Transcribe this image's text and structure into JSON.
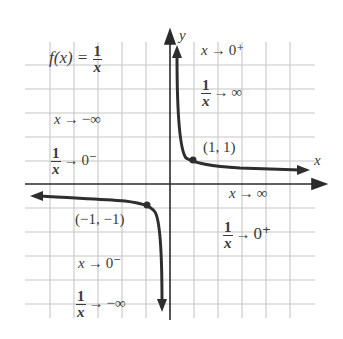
{
  "title": {
    "lhs": "f(x) =",
    "num": "1",
    "den": "x"
  },
  "axes": {
    "x_label": "x",
    "y_label": "y"
  },
  "points": [
    {
      "label": "(1, 1)",
      "x": 1,
      "y": 1
    },
    {
      "label": "(−1, −1)",
      "x": -1,
      "y": -1
    }
  ],
  "annotations": {
    "q1_top": {
      "left": "x",
      "arrow": "→",
      "right": "0⁺"
    },
    "q1_mid": {
      "num": "1",
      "den": "x",
      "arrow": "→",
      "right": "∞"
    },
    "q2_top": {
      "left": "x",
      "arrow": "→",
      "right": "−∞"
    },
    "q2_mid": {
      "num": "1",
      "den": "x",
      "arrow": "→",
      "right": "0⁻"
    },
    "q4_top": {
      "left": "x",
      "arrow": "→",
      "right": "∞"
    },
    "q4_mid": {
      "num": "1",
      "den": "x",
      "arrow": "→",
      "right": "0⁺"
    },
    "q3_top": {
      "left": "x",
      "arrow": "→",
      "right": "0⁻"
    },
    "q3_mid": {
      "num": "1",
      "den": "x",
      "arrow": "→",
      "right": "−∞"
    }
  },
  "colors": {
    "grid": "#c8c8c8",
    "axis": "#2a2a2a",
    "curve": "#2e2e2e",
    "text": "#3a3a3a"
  }
}
